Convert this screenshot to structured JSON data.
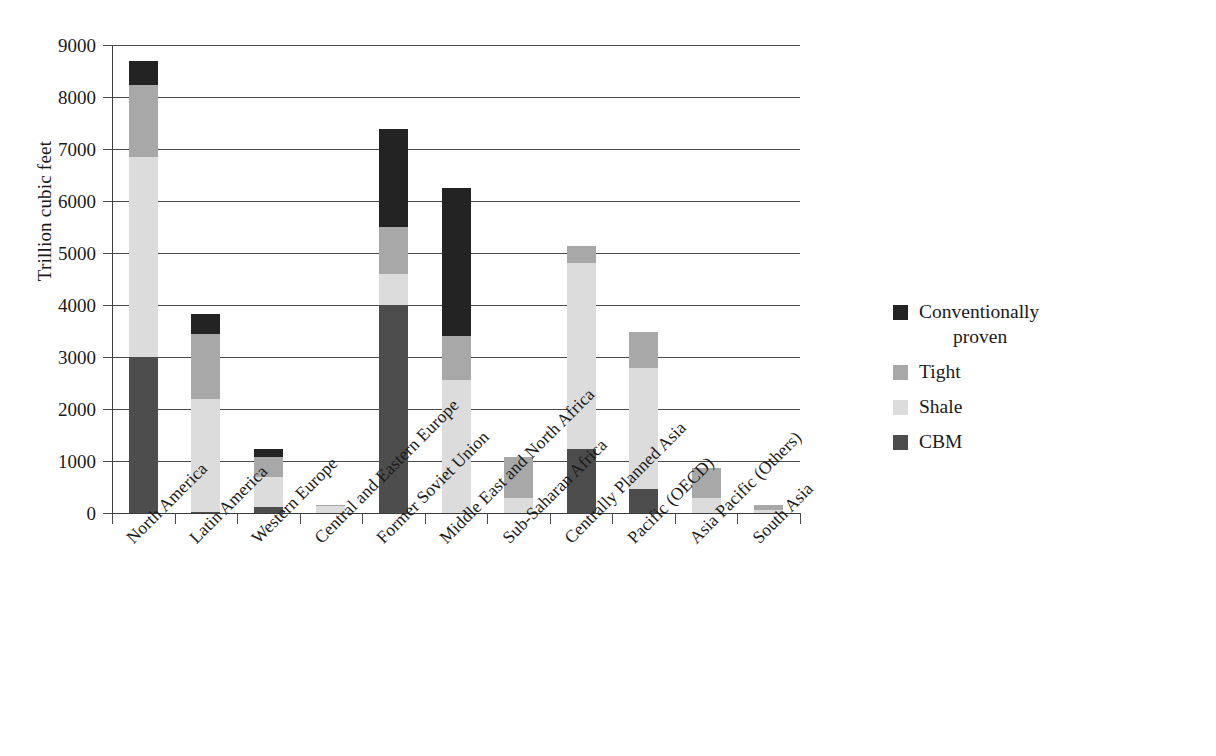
{
  "chart_data": {
    "type": "bar",
    "subtype": "stacked-vertical",
    "title": "",
    "xlabel": "",
    "ylabel": "Trillion cubic feet",
    "ylim": [
      0,
      9000
    ],
    "yticks": [
      0,
      1000,
      2000,
      3000,
      4000,
      5000,
      6000,
      7000,
      8000,
      9000
    ],
    "ytick_labels": [
      "0",
      "1000",
      "2000",
      "3000",
      "4000",
      "5000",
      "6000",
      "7000",
      "8000",
      "9000"
    ],
    "grid": "horizontal",
    "legend_position": "right",
    "categories": [
      "North America",
      "Latin America",
      "Western Europe",
      "Central and Eastern Europe",
      "Former Soviet Union",
      "Middle East and North Africa",
      "Sub-Saharan Africa",
      "Centrally Planned Asia",
      "Pacific (OECD)",
      "Asia Pacific (Others)",
      "South Asia"
    ],
    "series": [
      {
        "name": "CBM",
        "color": "#4d4d4d",
        "values": [
          3000,
          20,
          110,
          0,
          4000,
          0,
          0,
          1230,
          460,
          0,
          0
        ]
      },
      {
        "name": "Shale",
        "color": "#dcdcdc",
        "values": [
          3850,
          2180,
          590,
          130,
          600,
          2560,
          280,
          3570,
          2330,
          280,
          60
        ]
      },
      {
        "name": "Tight",
        "color": "#a8a8a8",
        "values": [
          1380,
          1250,
          370,
          30,
          900,
          840,
          790,
          340,
          700,
          580,
          90
        ]
      },
      {
        "name": "Conventionally proven",
        "color": "#232323",
        "values": [
          470,
          380,
          160,
          0,
          1880,
          2850,
          0,
          0,
          0,
          0,
          0
        ]
      }
    ],
    "totals": [
      8700,
      3830,
      1230,
      160,
      7380,
      6250,
      1070,
      5140,
      3490,
      860,
      150
    ],
    "stack_order_bottom_to_top": [
      "CBM",
      "Shale",
      "Tight",
      "Conventionally proven"
    ]
  },
  "legend": {
    "items": [
      {
        "label": "Conventionally proven",
        "label_line1": "Conventionally",
        "label_line2": "proven",
        "color": "#232323"
      },
      {
        "label": "Tight",
        "label_line1": "Tight",
        "label_line2": "",
        "color": "#a8a8a8"
      },
      {
        "label": "Shale",
        "label_line1": "Shale",
        "label_line2": "",
        "color": "#dcdcdc"
      },
      {
        "label": "CBM",
        "label_line1": "CBM",
        "label_line2": "",
        "color": "#4d4d4d"
      }
    ]
  }
}
